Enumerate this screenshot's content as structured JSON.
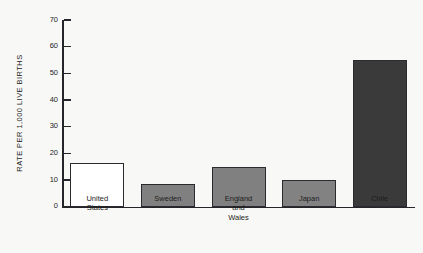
{
  "chart_data": {
    "type": "bar",
    "title": "",
    "subtitle": "",
    "xlabel": "",
    "ylabel": "RATE PER 1,000 LIVE BIRTHS",
    "ylim": [
      0,
      70
    ],
    "ytick_step": 10,
    "yticks": [
      "70",
      "60",
      "50",
      "40",
      "30",
      "20",
      "10",
      "0"
    ],
    "grid": false,
    "legend": false,
    "categories": [
      "United\nStates",
      "Sweden",
      "England\nand\nWales",
      "Japan",
      "Chile"
    ],
    "values": [
      16.5,
      8.5,
      15,
      10,
      55
    ],
    "bar_colors": [
      "#ffffff",
      "#808080",
      "#808080",
      "#828282",
      "#3a3a3a"
    ],
    "bar_edge_color": "#2b2b2f"
  },
  "colors": {
    "background": "#f8f8f6",
    "axis": "#26262a",
    "text": "#1d1d1d",
    "bar_light": "#ffffff",
    "bar_gray": "#808080",
    "bar_dark": "#3a3a3a"
  }
}
